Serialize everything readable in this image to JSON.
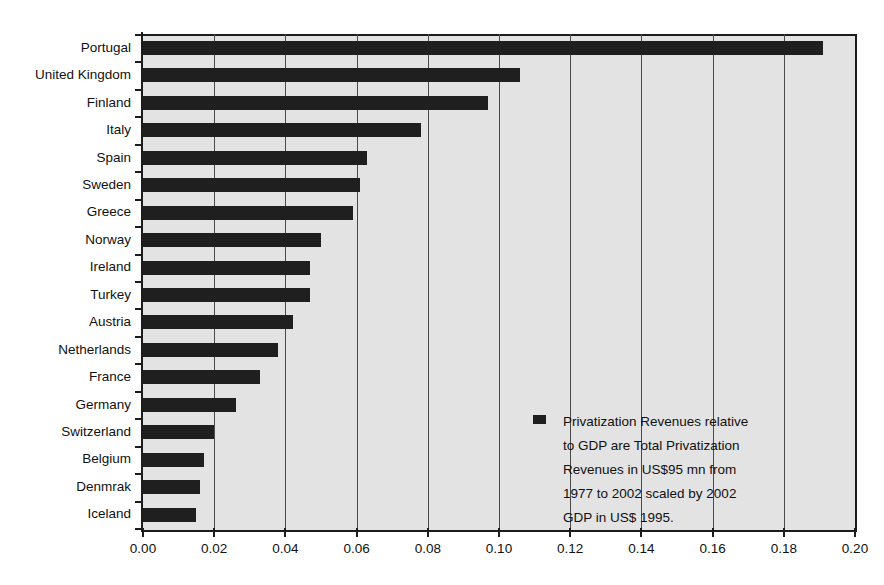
{
  "chart_data": {
    "type": "bar",
    "orientation": "horizontal",
    "title": "",
    "xlabel": "",
    "ylabel": "",
    "xlim": [
      0.0,
      0.2
    ],
    "xticks": [
      "0.00",
      "0.02",
      "0.04",
      "0.06",
      "0.08",
      "0.10",
      "0.12",
      "0.14",
      "0.16",
      "0.18",
      "0.20"
    ],
    "xtick_values": [
      0.0,
      0.02,
      0.04,
      0.06,
      0.08,
      0.1,
      0.12,
      0.14,
      0.16,
      0.18,
      0.2
    ],
    "grid": true,
    "grid_axis": "x",
    "categories": [
      "Portugal",
      "United Kingdom",
      "Finland",
      "Italy",
      "Spain",
      "Sweden",
      "Greece",
      "Norway",
      "Ireland",
      "Turkey",
      "Austria",
      "Netherlands",
      "France",
      "Germany",
      "Switzerland",
      "Belgium",
      "Denmrak",
      "Iceland"
    ],
    "values": [
      0.191,
      0.106,
      0.097,
      0.078,
      0.063,
      0.061,
      0.059,
      0.05,
      0.047,
      0.047,
      0.042,
      0.038,
      0.033,
      0.026,
      0.02,
      0.017,
      0.016,
      0.015
    ],
    "series": [
      {
        "name": "Privatization Revenues relative to GDP",
        "color": "#1f1f1f",
        "values": [
          0.191,
          0.106,
          0.097,
          0.078,
          0.063,
          0.061,
          0.059,
          0.05,
          0.047,
          0.047,
          0.042,
          0.038,
          0.033,
          0.026,
          0.02,
          0.017,
          0.016,
          0.015
        ]
      }
    ],
    "legend": {
      "position": "inside-bottom-right",
      "swatch_color": "#1f1f1f",
      "lines": [
        "Privatization Revenues relative",
        "to GDP are Total Privatization",
        "Revenues in US$95 mn from",
        "1977 to 2002 scaled by 2002",
        "GDP in US$ 1995."
      ]
    },
    "colors": {
      "bar": "#1f1f1f",
      "plot_background": "#e3e3e3",
      "axis": "#1c1c1c",
      "gridline": "#4a4a4a",
      "page_background": "#ffffff",
      "text": "#111111"
    }
  }
}
